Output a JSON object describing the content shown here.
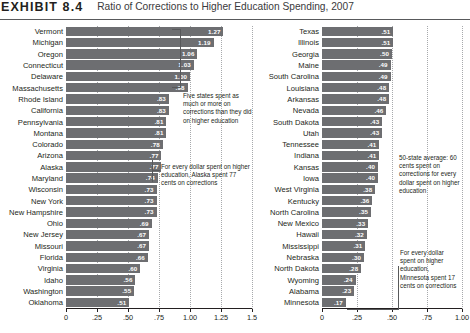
{
  "header": {
    "exhibit_label": "EXHIBIT 8.4",
    "title": "Ratio of Corrections to Higher Education Spending, 2007"
  },
  "chart_data": {
    "type": "bar",
    "title": "Ratio of Corrections to Higher Education Spending, 2007",
    "xlabel": "",
    "ylabel": "",
    "orientation": "horizontal",
    "grid": true,
    "legend": "none",
    "panels": [
      {
        "name": "left",
        "xlim": [
          0,
          1.5
        ],
        "ticks": [
          0,
          0.25,
          0.5,
          0.75,
          1.0,
          1.25,
          1.5
        ],
        "tick_labels": [
          "0",
          ".25",
          ".50",
          ".75",
          "1.00",
          "1.25",
          "1.5"
        ],
        "categories": [
          "Vermont",
          "Michigan",
          "Oregon",
          "Connecticut",
          "Delaware",
          "Massachusetts",
          "Rhode Island",
          "California",
          "Pennsylvania",
          "Montana",
          "Colorado",
          "Arizona",
          "Alaska",
          "Maryland",
          "Wisconsin",
          "New York",
          "New Hampshire",
          "Ohio",
          "New Jersey",
          "Missouri",
          "Florida",
          "Virginia",
          "Idaho",
          "Washington",
          "Oklahoma"
        ],
        "values": [
          1.27,
          1.19,
          1.06,
          1.03,
          1.0,
          0.98,
          0.83,
          0.83,
          0.81,
          0.81,
          0.78,
          0.77,
          0.77,
          0.74,
          0.73,
          0.73,
          0.73,
          0.69,
          0.67,
          0.67,
          0.66,
          0.6,
          0.56,
          0.55,
          0.51
        ],
        "value_labels": [
          "1.27",
          "1.19",
          "1.06",
          "1.03",
          "1.00",
          ".98",
          ".83",
          ".83",
          ".81",
          ".81",
          ".78",
          ".77",
          ".77",
          ".74",
          ".73",
          ".73",
          ".73",
          ".69",
          ".67",
          ".67",
          ".66",
          ".60",
          ".56",
          ".55",
          ".51"
        ]
      },
      {
        "name": "right",
        "xlim": [
          0,
          1.0
        ],
        "ticks": [
          0,
          0.25,
          0.5,
          0.75,
          1.0
        ],
        "tick_labels": [
          "0",
          ".25",
          ".50",
          ".75",
          "1.00"
        ],
        "categories": [
          "Texas",
          "Illinois",
          "Georgia",
          "Maine",
          "South Carolina",
          "Louisiana",
          "Arkansas",
          "Nevada",
          "South Dakota",
          "Utah",
          "Tennessee",
          "Indiana",
          "Kansas",
          "Iowa",
          "West Virginia",
          "Kentucky",
          "North Carolina",
          "New Mexico",
          "Hawaii",
          "Mississippi",
          "Nebraska",
          "North Dakota",
          "Wyoming",
          "Alabama",
          "Minnesota"
        ],
        "values": [
          0.51,
          0.51,
          0.5,
          0.49,
          0.49,
          0.48,
          0.48,
          0.46,
          0.43,
          0.43,
          0.41,
          0.41,
          0.4,
          0.4,
          0.38,
          0.36,
          0.35,
          0.33,
          0.32,
          0.31,
          0.3,
          0.28,
          0.24,
          0.23,
          0.17
        ],
        "value_labels": [
          ".51",
          ".51",
          ".50",
          ".49",
          ".49",
          ".48",
          ".48",
          ".46",
          ".43",
          ".43",
          ".41",
          ".41",
          ".40",
          ".40",
          ".38",
          ".36",
          ".35",
          ".33",
          ".32",
          ".31",
          ".30",
          ".28",
          ".24",
          ".23",
          ".17"
        ]
      }
    ],
    "annotations": [
      {
        "id": "five-states",
        "text": "Five states spent as much or more on corrections than they did on higher education"
      },
      {
        "id": "alaska",
        "text": "For every dollar spent on higher education, Alaska spent 77 cents on corrections"
      },
      {
        "id": "average",
        "text": "50-state average: 60 cents spent on corrections for every dollar spent on higher education"
      },
      {
        "id": "minnesota",
        "text": "For every dollar spent on higher education, Minnesota spent 17 cents on corrections"
      }
    ]
  },
  "colors": {
    "bar": "#6d6e71",
    "text": "#231f20",
    "axis": "#231f20",
    "grid": "#a7a9ac"
  }
}
